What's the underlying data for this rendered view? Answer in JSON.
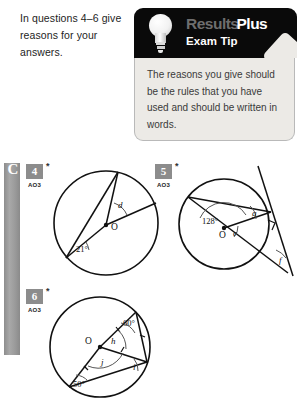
{
  "intro": {
    "text": "In questions 4–6 give reasons for your answers."
  },
  "exam_tip": {
    "brand_part1": "Results",
    "brand_part2": "Plus",
    "subtitle": "Exam Tip",
    "body": "The reasons you give should be the rules that you have used and should be written in words.",
    "bulb_icon": "lightbulb-icon",
    "header_bg": "#0a0a0a",
    "body_bg": "#eceae6"
  },
  "grade_bar": {
    "grade": "C",
    "color": "#9a9a9a"
  },
  "questions": [
    {
      "number": "4",
      "star": "*",
      "assessment_objective": "AO3",
      "figure": {
        "type": "circle-geometry",
        "centre_label": "O",
        "angles": [
          {
            "label": "21°",
            "kind": "given"
          },
          {
            "label": "d",
            "kind": "unknown"
          }
        ]
      }
    },
    {
      "number": "5",
      "star": "*",
      "assessment_objective": "AO3",
      "figure": {
        "type": "circle-geometry",
        "centre_label": "O",
        "angles": [
          {
            "label": "128°",
            "kind": "given"
          },
          {
            "label": "e",
            "kind": "unknown"
          },
          {
            "label": "g",
            "kind": "unknown"
          },
          {
            "label": "f",
            "kind": "unknown"
          }
        ],
        "right_angle_marker": true
      }
    },
    {
      "number": "6",
      "star": "*",
      "assessment_objective": "AO3",
      "figure": {
        "type": "circle-geometry",
        "centre_label": "O",
        "angles": [
          {
            "label": "60°",
            "kind": "given"
          },
          {
            "label": "50°",
            "kind": "given"
          },
          {
            "label": "h",
            "kind": "unknown"
          },
          {
            "label": "i",
            "kind": "unknown"
          },
          {
            "label": "j",
            "kind": "unknown"
          }
        ]
      }
    }
  ]
}
